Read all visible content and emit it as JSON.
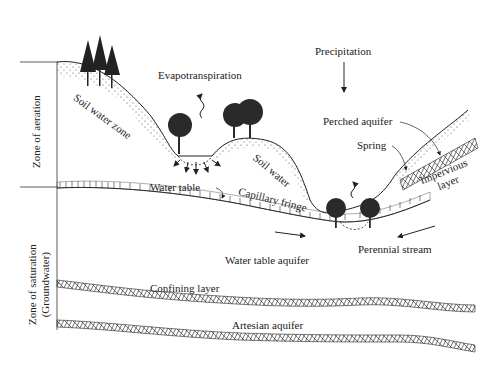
{
  "zones": {
    "aeration": "Zone of aeration",
    "saturation_line1": "Zone of saturation",
    "saturation_line2": "(Groundwater)"
  },
  "labels": {
    "precipitation": "Precipitation",
    "evapotranspiration": "Evapotranspiration",
    "soil_water_zone": "Soil water zone",
    "soil_water": "Soil water",
    "perched_aquifer": "Perched aquifer",
    "spring": "Spring",
    "impervious_layer_line1": "Impervious",
    "impervious_layer_line2": "layer",
    "water_table": "Water table",
    "capillary_fringe": "Capillary fringe",
    "perennial_stream": "Perennial stream",
    "water_table_aquifer": "Water table aquifer",
    "confining_layer": "Confining layer",
    "artesian_aquifer": "Artesian aquifer"
  },
  "colors": {
    "ink": "#1a1a1a",
    "background": "#ffffff"
  }
}
